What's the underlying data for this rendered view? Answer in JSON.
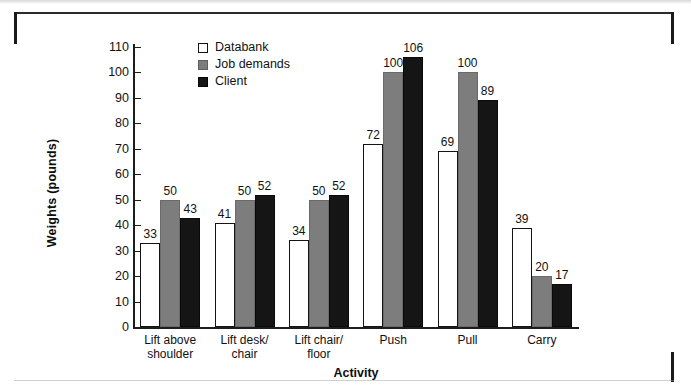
{
  "figure": {
    "background_color": "#ffffff",
    "frame_color": "#1a1a1a"
  },
  "chart_data": {
    "type": "bar",
    "title": "",
    "subtitle": "",
    "xlabel": "Activity",
    "ylabel": "Weights (pounds)",
    "ylim": [
      0,
      110
    ],
    "ytick_values": [
      0,
      10,
      20,
      30,
      40,
      50,
      60,
      70,
      80,
      90,
      100,
      110
    ],
    "ytick_labels": [
      "0",
      "10",
      "20",
      "30",
      "40",
      "50",
      "60",
      "70",
      "80",
      "90",
      "100",
      "110"
    ],
    "grid": false,
    "legend_position": "upper-left-inside",
    "categories": [
      "Lift above\nshoulder",
      "Lift desk/\nchair",
      "Lift chair/\nfloor",
      "Push",
      "Pull",
      "Carry"
    ],
    "category_lines": [
      [
        "Lift above",
        "shoulder"
      ],
      [
        "Lift desk/",
        "chair"
      ],
      [
        "Lift chair/",
        "floor"
      ],
      [
        "Push",
        ""
      ],
      [
        "Pull",
        ""
      ],
      [
        "Carry",
        ""
      ]
    ],
    "series": [
      {
        "name": "Databank",
        "color": "#ffffff",
        "edge_color": "#141414",
        "values": [
          33,
          41,
          34,
          72,
          69,
          39
        ]
      },
      {
        "name": "Job demands",
        "color": "#7d7d7d",
        "edge_color": "#6a6a6a",
        "values": [
          50,
          50,
          50,
          100,
          100,
          20
        ]
      },
      {
        "name": "Client",
        "color": "#151515",
        "edge_color": "#0a0a0a",
        "values": [
          43,
          52,
          52,
          106,
          89,
          17
        ]
      }
    ],
    "data_labels": [
      [
        "33",
        "50",
        "43"
      ],
      [
        "41",
        "50",
        "52"
      ],
      [
        "34",
        "50",
        "52"
      ],
      [
        "72",
        "100",
        "106"
      ],
      [
        "69",
        "100",
        "89"
      ],
      [
        "39",
        "20",
        "17"
      ]
    ]
  }
}
